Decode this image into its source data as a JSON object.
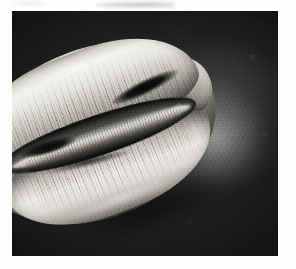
{
  "page": {
    "background_color": "#fdfdfd",
    "type": "scanned-book-page",
    "margins": {
      "left_px": 12,
      "top_px": 11,
      "right_px": 18,
      "bottom_px": 13
    }
  },
  "plate": {
    "name": "photographic-plate",
    "medium": "black-and-white halftone photograph",
    "x": 12,
    "y": 11,
    "width": 266,
    "height": 245,
    "backdrop_color": "#1b1b1b",
    "highlight_color": "#f4f3ef",
    "midtone_color": "#a5a29b",
    "shadow_color": "#101010"
  },
  "subject": {
    "name": "specimen",
    "description": "Ovoid shell-like specimen photographed against a dark mottled backdrop, lit from the upper right.",
    "orientation_degrees": -21,
    "features": [
      {
        "name": "upper-lip",
        "label": "Upper lip (dorsum) with fine vertical striations"
      },
      {
        "name": "lower-lip",
        "label": "Lower lip with fine vertical striations"
      },
      {
        "name": "aperture",
        "label": "Central longitudinal aperture groove"
      },
      {
        "name": "aperture-ridge",
        "label": "Bright toothed ridge inside the aperture"
      },
      {
        "name": "slit-right",
        "label": "Deep dark notch at the right end of the aperture"
      },
      {
        "name": "slit-left",
        "label": "Dark slit left of centre in the aperture"
      },
      {
        "name": "anterior-tip",
        "label": "Anterior beak-like tip at lower left"
      },
      {
        "name": "posterior-tip",
        "label": "Posterior rounded tip at right"
      },
      {
        "name": "halo",
        "label": "Soft light bloom on the backdrop to the right of the specimen"
      }
    ]
  },
  "artifacts": {
    "scan_smudge": "Faint grey bleed-through marks in the top margin above the plate",
    "grain": "Visible photographic film grain / halftone speckle across the plate"
  }
}
